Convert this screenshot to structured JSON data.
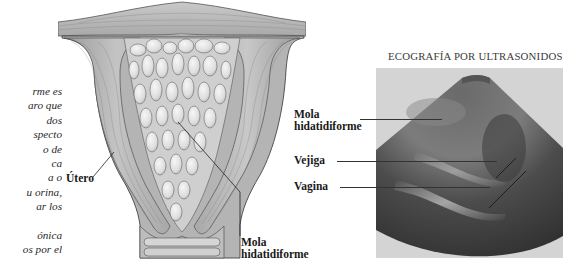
{
  "side_text": {
    "lines": [
      "rme es",
      "aro que",
      "dos",
      "specto",
      "o de",
      "ca",
      "a o",
      "u orina,",
      "ar los",
      "",
      "ónica",
      "os por el"
    ]
  },
  "illustration": {
    "label_utero": "Útero",
    "label_mola_line1": "Mola",
    "label_mola_line2": "hidatidiforme"
  },
  "ultrasound": {
    "title": "ECOGRAFÍA POR ULTRASONIDOS",
    "labels": {
      "mola_line1": "Mola",
      "mola_line2": "hidatidiforme",
      "vejiga": "Vejiga",
      "vagina": "Vagina"
    }
  },
  "colors": {
    "background": "#ffffff",
    "illustration_tissue": "#b8b8b8",
    "illustration_vesicles": "#e8e8e8",
    "ultrasound_bg": "#d4d4d4",
    "ultrasound_scan": "#4a4a4a"
  }
}
